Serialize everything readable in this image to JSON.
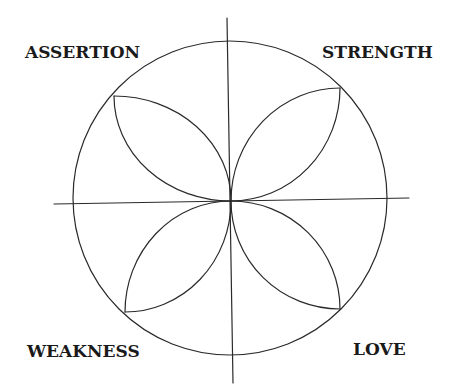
{
  "diagram": {
    "type": "quadrant-flower",
    "stroke_color": "#2a2a2a",
    "background": "#ffffff",
    "center": {
      "x": 231,
      "y": 201
    },
    "circle": {
      "cx": 230,
      "cy": 198,
      "r": 157
    },
    "axes": {
      "vertical": {
        "x1": 227,
        "y1": 18,
        "x2": 233,
        "y2": 383
      },
      "horizontal": {
        "x1": 54,
        "y1": 204,
        "x2": 409,
        "y2": 198
      }
    },
    "petals": [
      {
        "quadrant": "top-left",
        "tip": {
          "x": 114,
          "y": 96
        }
      },
      {
        "quadrant": "top-right",
        "tip": {
          "x": 340,
          "y": 88
        }
      },
      {
        "quadrant": "bottom-left",
        "tip": {
          "x": 125,
          "y": 312
        }
      },
      {
        "quadrant": "bottom-right",
        "tip": {
          "x": 340,
          "y": 309
        }
      }
    ]
  },
  "labels": {
    "top_left": "ASSERTION",
    "top_right": "STRENGTH",
    "bottom_left": "WEAKNESS",
    "bottom_right": "LOVE"
  }
}
